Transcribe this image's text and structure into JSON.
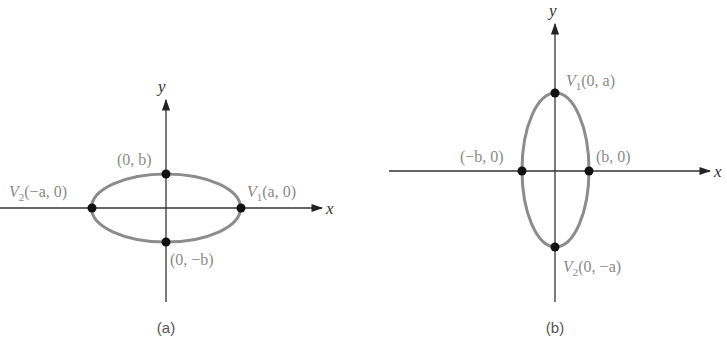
{
  "figures": [
    {
      "id": "a",
      "caption": "(a)",
      "axis_labels": {
        "x": "x",
        "y": "y"
      },
      "orientation": "horizontal major axis",
      "points": {
        "top": {
          "label": "(0, b)"
        },
        "bottom": {
          "label": "(0, −b)"
        },
        "left_vertex": {
          "name": "V",
          "sub": "2",
          "coords": "(−a, 0)"
        },
        "right_vertex": {
          "name": "V",
          "sub": "1",
          "coords": "(a, 0)"
        }
      }
    },
    {
      "id": "b",
      "caption": "(b)",
      "axis_labels": {
        "x": "x",
        "y": "y"
      },
      "orientation": "vertical major axis",
      "points": {
        "top_vertex": {
          "name": "V",
          "sub": "1",
          "coords": "(0, a)"
        },
        "bottom_vertex": {
          "name": "V",
          "sub": "2",
          "coords": "(0, −a)"
        },
        "left": {
          "label": "(−b, 0)"
        },
        "right": {
          "label": "(b, 0)"
        }
      }
    }
  ],
  "colors": {
    "axis": "#333333",
    "ellipse": "#8c8c8c",
    "point": "#111111",
    "label": "#8a8a8a"
  }
}
